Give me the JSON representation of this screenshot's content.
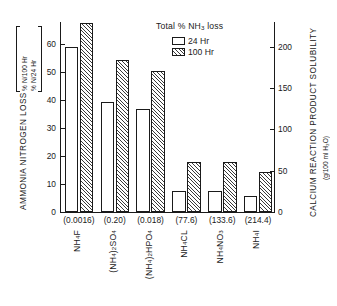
{
  "chart_data": {
    "type": "bar",
    "title": "",
    "categories": [
      "NH4F",
      "(NH4)2SO4",
      "(NH4)2HPO4",
      "NH4CL",
      "NH4NO3",
      "NH4I"
    ],
    "series": [
      {
        "name": "24 Hr",
        "values": [
          59.0,
          39.5,
          36.8,
          7.6,
          7.7,
          5.9
        ]
      },
      {
        "name": "100 Hr",
        "values": [
          67.8,
          54.5,
          50.5,
          17.8,
          17.8,
          14.3
        ]
      }
    ],
    "secondary_series": {
      "name": "Calcium reaction product solubility",
      "values": [
        0.0016,
        0.2,
        0.018,
        77.6,
        133.6,
        214.4
      ],
      "axis": "right"
    },
    "ylabel": "AMMONIA NITROGEN LOSS",
    "ylabel_units": [
      "% N/24 Hr",
      "% N/100 Hr"
    ],
    "ylim": [
      0,
      68
    ],
    "yticks": [
      0,
      10,
      20,
      30,
      40,
      50,
      60
    ],
    "y2label": "CALCIUM REACTION PRODUCT SOLUBILITY",
    "y2label_units": "(g/100 ml H₂O)",
    "y2lim": [
      0,
      230
    ],
    "y2ticks": [
      0,
      50,
      100,
      150,
      200
    ],
    "xlabel": "",
    "grid": false,
    "legend_position": "top-center"
  },
  "axes": {
    "left": {
      "title": "AMMONIA NITROGEN LOSS",
      "unit_top": "% N/24 Hr",
      "unit_bottom": "% N/100 Hr",
      "ticks": [
        "60",
        "50",
        "40",
        "30",
        "20",
        "10",
        "0"
      ]
    },
    "right": {
      "title": "CALCIUM REACTION PRODUCT SOLUBILITY",
      "units": "(g/100 ml H₂O)",
      "ticks": [
        "200",
        "150",
        "100",
        "50",
        "0"
      ]
    }
  },
  "legend": {
    "title_parts": {
      "pre": "Total % NH",
      "sub": "3",
      "post": " loss"
    },
    "entries": [
      {
        "label": "24 Hr",
        "style": "open"
      },
      {
        "label": "100 Hr",
        "style": "hatched"
      }
    ]
  },
  "categories": [
    {
      "solubility": "(0.0016)",
      "formula_parts": [
        {
          "t": "NH"
        },
        {
          "t": "4",
          "sub": true
        },
        {
          "t": "F"
        }
      ]
    },
    {
      "solubility": "(0.20)",
      "formula_parts": [
        {
          "t": "(NH"
        },
        {
          "t": "4",
          "sub": true
        },
        {
          "t": ")"
        },
        {
          "t": "2",
          "sub": true
        },
        {
          "t": "SO"
        },
        {
          "t": "4",
          "sub": true
        }
      ]
    },
    {
      "solubility": "(0.018)",
      "formula_parts": [
        {
          "t": "(NH"
        },
        {
          "t": "4",
          "sub": true
        },
        {
          "t": ")"
        },
        {
          "t": "2",
          "sub": true
        },
        {
          "t": "HPO"
        },
        {
          "t": "4",
          "sub": true
        }
      ]
    },
    {
      "solubility": "(77.6)",
      "formula_parts": [
        {
          "t": "NH"
        },
        {
          "t": "4",
          "sub": true
        },
        {
          "t": "CL"
        }
      ]
    },
    {
      "solubility": "(133.6)",
      "formula_parts": [
        {
          "t": "NH"
        },
        {
          "t": "4",
          "sub": true
        },
        {
          "t": "NO"
        },
        {
          "t": "3",
          "sub": true
        }
      ]
    },
    {
      "solubility": "(214.4)",
      "formula_parts": [
        {
          "t": "NH"
        },
        {
          "t": "4",
          "sub": true
        },
        {
          "t": "I"
        }
      ]
    }
  ],
  "colors": {
    "ink": "#1a1a1a",
    "background": "#ffffff",
    "hatch": "#3a3a3a"
  }
}
